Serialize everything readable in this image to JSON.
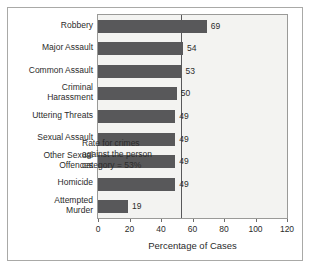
{
  "chart_data": {
    "type": "bar",
    "orientation": "horizontal",
    "title": "",
    "xlabel": "Percentage of Cases",
    "ylabel": "",
    "xlim": [
      0,
      120
    ],
    "xticks": [
      0,
      20,
      40,
      60,
      80,
      100,
      120
    ],
    "grid": false,
    "legend": null,
    "categories": [
      "Robbery",
      "Major Assault",
      "Common Assault",
      "Criminal\nHarassment",
      "Uttering Threats",
      "Sexual Assault",
      "Other Sexual\nOffences",
      "Homicide",
      "Attempted\nMurder"
    ],
    "values": [
      69,
      54,
      53,
      50,
      49,
      49,
      49,
      49,
      19
    ],
    "data_labels": [
      "69",
      "54",
      "53",
      "50",
      "49",
      "49",
      "49",
      "49",
      "19"
    ],
    "reference_line": {
      "value": 53,
      "label": "Rate for crimes against the person category = 53%"
    },
    "annotation_lines": [
      "Rate for crimes",
      "against the person",
      "category = 53%"
    ],
    "colors": {
      "bar": "#58585a",
      "plot_background": "#f3f3f1",
      "figure_background": "#ffffff",
      "axis": "#9a9a98",
      "reference_line": "#58585a",
      "text": "#2b2b2b"
    }
  },
  "axis": {
    "x_tick_labels": [
      "0",
      "20",
      "40",
      "60",
      "80",
      "100",
      "120"
    ],
    "x_title": "Percentage of Cases"
  }
}
